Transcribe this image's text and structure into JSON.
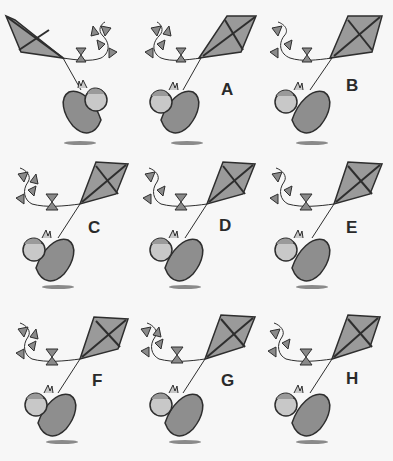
{
  "puzzle": {
    "reference": {
      "label": ""
    },
    "options": [
      {
        "label": "A"
      },
      {
        "label": "B"
      },
      {
        "label": "C"
      },
      {
        "label": "D"
      },
      {
        "label": "E"
      },
      {
        "label": "F"
      },
      {
        "label": "G"
      },
      {
        "label": "H"
      }
    ]
  },
  "colors": {
    "background": "#f7f7f7",
    "kite_fill": "#9a9a9a",
    "outline": "#2e2e2e",
    "shirt": "#8e8e8e",
    "skin": "#c8c8c8",
    "shadow": "#8a8a8a"
  }
}
